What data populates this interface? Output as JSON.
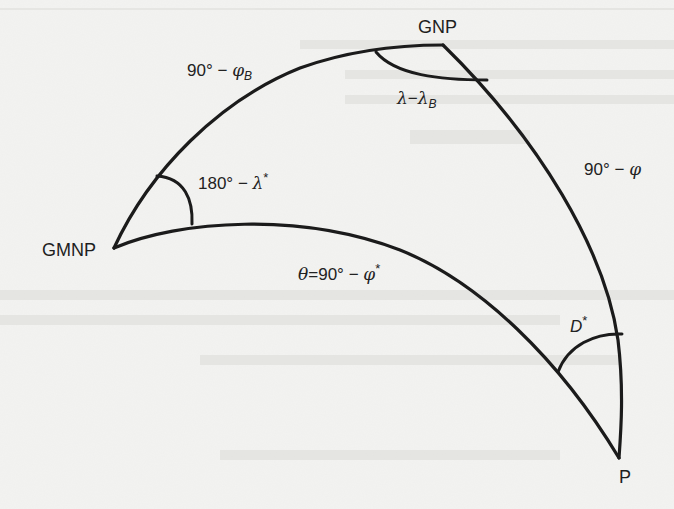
{
  "diagram": {
    "type": "spherical-triangle",
    "colors": {
      "background": "#f3f3f1",
      "stroke": "#1b1b1b",
      "text": "#222222"
    },
    "vertices": {
      "gnp": {
        "label": "GNP",
        "x": 443,
        "y": 45
      },
      "gmnp": {
        "label": "GMNP",
        "x": 114,
        "y": 248
      },
      "p": {
        "label": "P",
        "x": 619,
        "y": 458
      }
    },
    "edge_labels": {
      "gmnp_gnp": {
        "value": "90°",
        "op": "−",
        "sym": "φ",
        "sub": "B"
      },
      "gnp_p": {
        "value": "90°",
        "op": "−",
        "sym": "φ"
      },
      "gmnp_p": {
        "prefix": "θ",
        "eq": "=",
        "value": "90°",
        "op": "−",
        "sym": "φ",
        "sup": "*"
      }
    },
    "angle_labels": {
      "at_gnp": {
        "sym": "λ",
        "op": "−",
        "sym2": "λ",
        "sub": "B"
      },
      "at_gmnp": {
        "value": "180°",
        "op": "−",
        "sym": "λ",
        "sup": "*"
      },
      "at_p": {
        "sym": "D",
        "sup": "*"
      }
    }
  }
}
